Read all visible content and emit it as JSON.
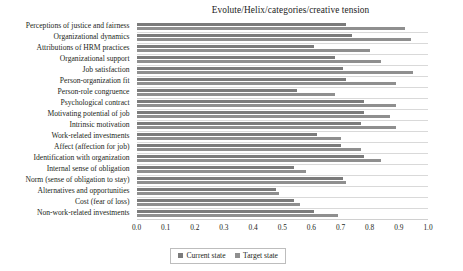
{
  "chart_data": {
    "type": "bar",
    "orientation": "horizontal",
    "title": "Evolute/Helix/categories/creative tension",
    "xlabel": "",
    "ylabel": "",
    "xlim": [
      0.0,
      1.0
    ],
    "xticks": [
      "0.0",
      "0.1",
      "0.2",
      "0.3",
      "0.4",
      "0.5",
      "0.6",
      "0.7",
      "0.8",
      "0.9",
      "1.0"
    ],
    "grid": true,
    "legend_position": "bottom-center",
    "categories": [
      "Perceptions of justice and fairness",
      "Organizational dynamics",
      "Attributions of HRM practices",
      "Organizational support",
      "Job satisfaction",
      "Person-organization fit",
      "Person-role congruence",
      "Psychological contract",
      "Motivating potential of job",
      "Intrinsic motivation",
      "Work-related investments",
      "Affect (affection for job)",
      "Identification with organization",
      "Internal sense of obligation",
      "Norm (sense of obligation to stay)",
      "Alternatives and opportunities",
      "Cost (fear of loss)",
      "Non-work-related investments"
    ],
    "series": [
      {
        "name": "Current state",
        "color": "#7b7b7b",
        "values": [
          0.72,
          0.74,
          0.61,
          0.68,
          0.71,
          0.72,
          0.55,
          0.78,
          0.78,
          0.77,
          0.62,
          0.7,
          0.78,
          0.54,
          0.71,
          0.48,
          0.54,
          0.61
        ]
      },
      {
        "name": "Target state",
        "color": "#8f8f8f",
        "values": [
          0.92,
          0.94,
          0.8,
          0.84,
          0.95,
          0.89,
          0.68,
          0.89,
          0.87,
          0.89,
          0.7,
          0.77,
          0.84,
          0.58,
          0.72,
          0.49,
          0.56,
          0.69
        ]
      }
    ]
  },
  "legend": {
    "items": [
      {
        "label": "Current state",
        "color": "#7b7b7b"
      },
      {
        "label": "Target state",
        "color": "#8f8f8f"
      }
    ]
  }
}
